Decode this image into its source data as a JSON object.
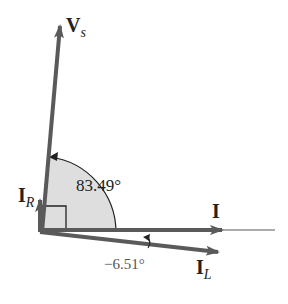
{
  "diagram": {
    "type": "phasor",
    "phasors": [
      {
        "name": "Vs",
        "label": "V",
        "subscript": "s",
        "angle_deg": 83.49
      },
      {
        "name": "I",
        "label": "I",
        "subscript": "",
        "angle_deg": 0
      },
      {
        "name": "IR",
        "label": "I",
        "subscript": "R",
        "angle_deg": 90
      },
      {
        "name": "IL",
        "label": "I",
        "subscript": "L",
        "angle_deg": -6.51
      }
    ],
    "angles": {
      "vs_angle": "83.49°",
      "il_angle": "−6.51°"
    },
    "colors": {
      "phasor": "#5a5a5a",
      "sector_fill": "#dedede",
      "text": "#222222"
    }
  }
}
